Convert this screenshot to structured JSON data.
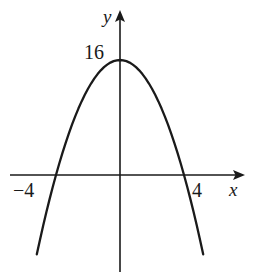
{
  "figure": {
    "name": "parabola-graph",
    "background_color": "#ffffff",
    "ink_color": "#1a1a1a"
  },
  "axes": {
    "y_axis_label": "y",
    "x_axis_label": "x",
    "y_axis_label_icon": "y-axis-arrow-icon",
    "x_axis_label_icon": "x-axis-arrow-icon"
  },
  "labels": {
    "vertex_value": "16",
    "left_root": "−4",
    "right_root": "4"
  },
  "chart_data": {
    "type": "line",
    "title": "",
    "subtitle": "",
    "xlabel": "x",
    "ylabel": "y",
    "equation": "y = 16 - x^2",
    "curve_shape": "downward parabola",
    "vertex": [
      0,
      16
    ],
    "roots": [
      -4,
      4
    ],
    "y_intercept": 16,
    "xlim": [
      -5.4,
      5.4
    ],
    "ylim": [
      -13,
      18
    ],
    "grid": false,
    "legend": false,
    "legend_position": "none",
    "axis_ticks_shown": {
      "x": [
        -4,
        4
      ],
      "y": [
        16
      ]
    },
    "tick_labels": {
      "x": [
        "−4",
        "4"
      ],
      "y": [
        "16"
      ]
    },
    "annotations": [],
    "x": [
      -5.2,
      -5.0,
      -4.8,
      -4.6,
      -4.4,
      -4.2,
      -4.0,
      -3.8,
      -3.6,
      -3.4,
      -3.2,
      -3.0,
      -2.8,
      -2.6,
      -2.4,
      -2.2,
      -2.0,
      -1.8,
      -1.6,
      -1.4,
      -1.2,
      -1.0,
      -0.8,
      -0.6,
      -0.4,
      -0.2,
      0.0,
      0.2,
      0.4,
      0.6,
      0.8,
      1.0,
      1.2,
      1.4,
      1.6,
      1.8,
      2.0,
      2.2,
      2.4,
      2.6,
      2.8,
      3.0,
      3.2,
      3.4,
      3.6,
      3.8,
      4.0,
      4.2,
      4.4,
      4.6,
      4.8,
      5.0,
      5.2
    ],
    "series": [
      {
        "name": "y = 16 - x^2",
        "color": "#1a1a1a",
        "values": [
          -11.04,
          -9.0,
          -7.04,
          -5.16,
          -3.36,
          -1.64,
          0.0,
          1.56,
          3.04,
          4.44,
          5.76,
          7.0,
          8.16,
          9.24,
          10.24,
          11.16,
          12.0,
          12.76,
          13.44,
          14.04,
          14.56,
          15.0,
          15.36,
          15.64,
          15.84,
          15.96,
          16.0,
          15.96,
          15.84,
          15.64,
          15.36,
          15.0,
          14.56,
          14.04,
          13.44,
          12.76,
          12.0,
          11.16,
          10.24,
          9.24,
          8.16,
          7.0,
          5.76,
          4.44,
          3.04,
          1.56,
          0.0,
          -1.64,
          -3.36,
          -5.16,
          -7.04,
          -9.0,
          -11.04
        ]
      }
    ]
  }
}
